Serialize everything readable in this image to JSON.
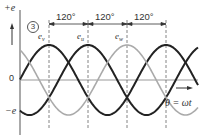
{
  "figure": {
    "marker": "3",
    "y_axis_pos_label": "+e",
    "y_axis_neg_label": "−e",
    "origin_label": "0",
    "x_axis_label": "θ = ωt",
    "phase_intervals": [
      "120°",
      "120°",
      "120°"
    ],
    "phase_labels": [
      {
        "base": "e",
        "sub": "v"
      },
      {
        "base": "e",
        "sub": "u"
      },
      {
        "base": "e",
        "sub": "w"
      }
    ]
  },
  "colors": {
    "curve_black": "#222222",
    "curve_gray": "#aaaaaa",
    "axis": "#555555",
    "guide": "#666666"
  },
  "chart_data": {
    "type": "line",
    "title": "",
    "xlabel": "θ = ωt",
    "ylabel": "e",
    "ylim": [
      -1,
      1
    ],
    "phase_shift_deg": 120,
    "series": [
      {
        "name": "e_v",
        "color": "black",
        "peak_at_deg": 90
      },
      {
        "name": "e_u",
        "color": "black",
        "peak_at_deg": 210
      },
      {
        "name": "e_w",
        "color": "gray",
        "peak_at_deg": 330
      }
    ]
  }
}
